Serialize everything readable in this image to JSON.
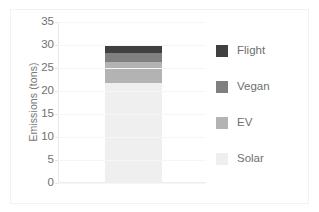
{
  "chart_data": {
    "type": "bar",
    "subtype": "stacked-bar-single-category",
    "title": "",
    "xlabel": "",
    "ylabel": "Emissions (tons)",
    "ylim": [
      0,
      35
    ],
    "ytick_values": [
      0,
      5,
      10,
      15,
      20,
      25,
      30,
      35
    ],
    "ytick_labels": [
      "0",
      "5",
      "10",
      "15",
      "20",
      "25",
      "30",
      "35"
    ],
    "xtick_labels": [],
    "categories": [
      ""
    ],
    "grid": true,
    "grid_axis": "y",
    "legend_position": "right",
    "stack_order_bottom_to_top": [
      "Solar",
      "EV",
      "Vegan",
      "Flight"
    ],
    "series": [
      {
        "name": "Solar",
        "values": [
          21.8
        ],
        "color": "#efefef",
        "cumulative_top": 21.8
      },
      {
        "name": "EV",
        "values": [
          4.5
        ],
        "color": "#b3b3b3",
        "cumulative_top": 26.3
      },
      {
        "name": "Vegan",
        "values": [
          1.9
        ],
        "color": "#808080",
        "cumulative_top": 28.2
      },
      {
        "name": "Flight",
        "values": [
          1.6
        ],
        "color": "#404040",
        "cumulative_top": 29.8
      }
    ],
    "total": 29.8
  },
  "axis": {
    "y_title": "Emissions (tons)",
    "ticks": [
      {
        "label": "35",
        "value": 35
      },
      {
        "label": "30",
        "value": 30
      },
      {
        "label": "25",
        "value": 25
      },
      {
        "label": "20",
        "value": 20
      },
      {
        "label": "15",
        "value": 15
      },
      {
        "label": "10",
        "value": 10
      },
      {
        "label": "5",
        "value": 5
      },
      {
        "label": "0",
        "value": 0
      }
    ]
  },
  "legend": {
    "items": [
      {
        "label": "Flight",
        "color": "#404040"
      },
      {
        "label": "Vegan",
        "color": "#808080"
      },
      {
        "label": "EV",
        "color": "#b3b3b3"
      },
      {
        "label": "Solar",
        "color": "#efefef"
      }
    ]
  }
}
